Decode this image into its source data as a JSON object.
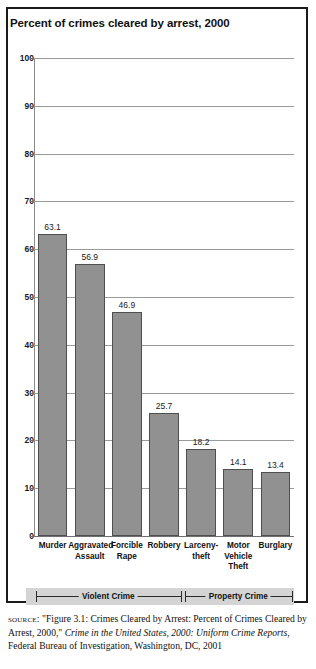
{
  "figure": {
    "title": "Percent of crimes cleared by arrest, 2000",
    "source_label": "source:",
    "source_part1": " \"Figure 3.1: Crimes Cleared by Arrest: Percent of Crimes Cleared by Arrest, 2000,\" ",
    "source_italic1": "Crime in the United States, 2000: Uniform Crime Reports",
    "source_part2": ", Federal Bureau of Investigation, Washington, DC, 2001"
  },
  "chart_data": {
    "type": "bar",
    "title": "Percent of crimes cleared by arrest, 2000",
    "xlabel": "",
    "ylabel": "",
    "ylim": [
      0,
      100
    ],
    "grid": true,
    "legend": "none",
    "bar_color": "#919191",
    "bar_border_color": "#4e4e4e",
    "categories": [
      "Murder",
      "Aggravated Assault",
      "Forcible Rape",
      "Robbery",
      "Larceny-theft",
      "Motor Vehicle Theft",
      "Burglary"
    ],
    "category_lines": [
      [
        "Murder"
      ],
      [
        "Aggravated",
        "Assault"
      ],
      [
        "Forcible",
        "Rape"
      ],
      [
        "Robbery"
      ],
      [
        "Larceny-",
        "theft"
      ],
      [
        "Motor",
        "Vehicle",
        "Theft"
      ],
      [
        "Burglary"
      ]
    ],
    "values": [
      63.1,
      56.9,
      46.9,
      25.7,
      18.2,
      14.1,
      13.4
    ],
    "value_labels": [
      "63.1",
      "56.9",
      "46.9",
      "25.7",
      "18.2",
      "14.1",
      "13.4"
    ],
    "yticks": [
      0,
      10,
      20,
      30,
      40,
      50,
      60,
      70,
      80,
      90,
      100
    ],
    "ytick_labels": [
      "0",
      "10",
      "20",
      "30",
      "40",
      "50",
      "60",
      "70",
      "80",
      "90",
      "100"
    ],
    "groups": [
      {
        "label": "Violent Crime",
        "categories": [
          "Murder",
          "Aggravated Assault",
          "Forcible Rape",
          "Robbery"
        ]
      },
      {
        "label": "Property Crime",
        "categories": [
          "Larceny-theft",
          "Motor Vehicle Theft",
          "Burglary"
        ]
      }
    ]
  }
}
